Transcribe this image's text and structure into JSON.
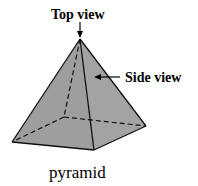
{
  "diagram": {
    "labels": {
      "top_view": "Top view",
      "side_view": "Side view",
      "caption": "pyramid"
    },
    "colors": {
      "face_fill": "#9e9e9e",
      "edge": "#111111",
      "background": "#ffffff"
    }
  }
}
